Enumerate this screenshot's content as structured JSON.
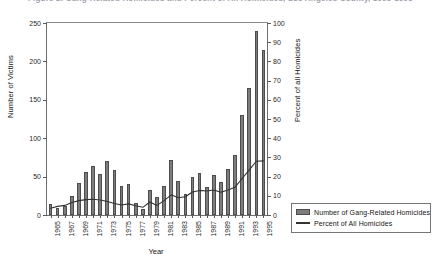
{
  "figure": {
    "cut_title": "Figure 2.  Gang-Related Homicides and Percent of All Homicides, Los Angeles County, 1965-1995"
  },
  "axes": {
    "left_title": "Number of Victims",
    "right_title": "Percent of all Homicides",
    "x_title": "Year",
    "left_ticks": [
      0,
      50,
      100,
      150,
      200,
      250
    ],
    "right_ticks": [
      0,
      10,
      20,
      30,
      40,
      50,
      60,
      70,
      80,
      90,
      100
    ],
    "x_tick_labels": [
      "1965",
      "1967",
      "1969",
      "1971",
      "1973",
      "1975",
      "1977",
      "1979",
      "1981",
      "1983",
      "1985",
      "1987",
      "1989",
      "1991",
      "1993",
      "1995"
    ]
  },
  "legend": {
    "items": [
      {
        "label": "Number of Gang-Related Homicides",
        "swatch": "bar-swatch",
        "color": "#7d7d7d"
      },
      {
        "label": "Percent of All Homicides",
        "swatch": "line-swatch",
        "color": "#333333"
      }
    ]
  },
  "colors": {
    "bar_fill": "#7d7d7d",
    "bar_edge": "#4d4d4d",
    "line": "#333333",
    "axis": "#6e6e6e"
  },
  "chart_data": {
    "type": "bar",
    "xlabel": "Year",
    "ylabel": "Number of Victims",
    "y2label": "Percent of all Homicides",
    "ylim": [
      0,
      250
    ],
    "y2lim": [
      0,
      100
    ],
    "grid": false,
    "legend_position": "right",
    "categories": [
      "1965",
      "1966",
      "1967",
      "1968",
      "1969",
      "1970",
      "1971",
      "1972",
      "1973",
      "1974",
      "1975",
      "1976",
      "1977",
      "1978",
      "1979",
      "1980",
      "1981",
      "1982",
      "1983",
      "1984",
      "1985",
      "1986",
      "1987",
      "1988",
      "1989",
      "1990",
      "1991",
      "1992",
      "1993",
      "1994",
      "1995"
    ],
    "series": [
      {
        "name": "Number of Gang-Related Homicides",
        "type": "bar",
        "axis": "left",
        "values": [
          14,
          9,
          12,
          25,
          42,
          56,
          64,
          53,
          70,
          58,
          38,
          41,
          15,
          8,
          32,
          23,
          38,
          72,
          44,
          27,
          50,
          55,
          37,
          52,
          43,
          60,
          78,
          130,
          165,
          240,
          215
        ]
      },
      {
        "name": "Percent of All Homicides",
        "type": "line",
        "axis": "right",
        "values": [
          3.5,
          4.5,
          5.0,
          6.5,
          7.5,
          8.0,
          8.2,
          7.8,
          7.0,
          6.0,
          5.2,
          5.8,
          4.8,
          4.0,
          6.8,
          5.0,
          7.5,
          10.5,
          9.0,
          9.5,
          12.0,
          12.8,
          12.5,
          13.0,
          11.8,
          13.0,
          14.5,
          19.0,
          23.5,
          28.0,
          28.2
        ]
      }
    ]
  }
}
